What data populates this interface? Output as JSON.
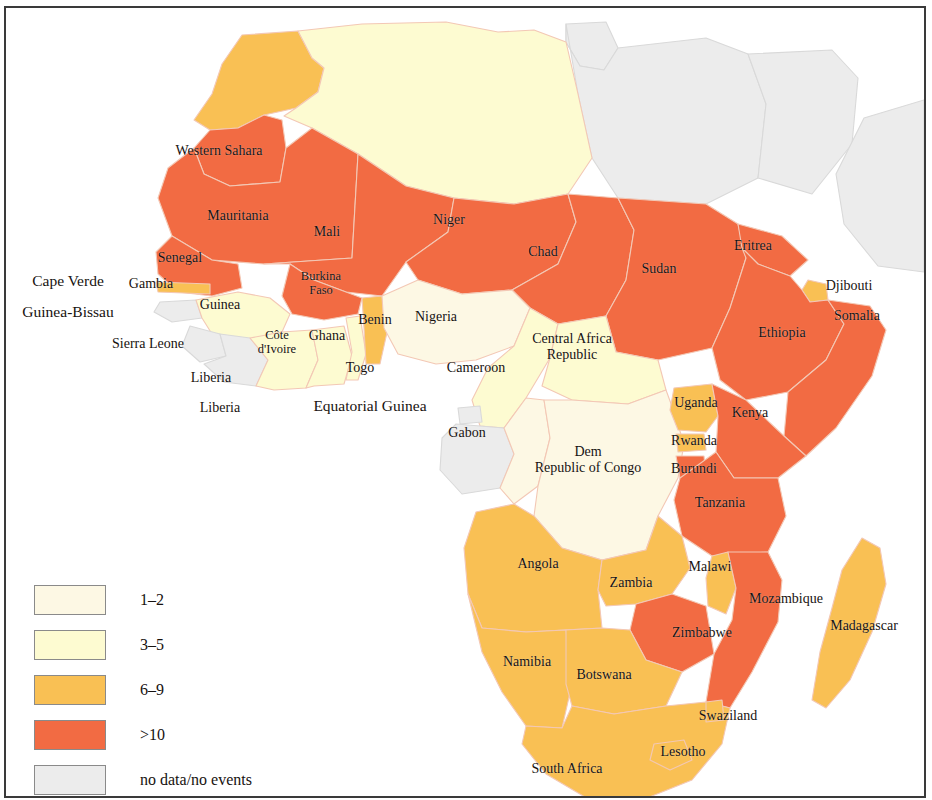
{
  "map": {
    "title": "Africa — reported events by country",
    "region": "Africa",
    "background_color": "#ffffff",
    "border_color": "#3a3a3a",
    "country_border_color": "#f3c8b5",
    "ocean_color": "#ffffff"
  },
  "legend": {
    "title": "",
    "items": [
      {
        "label": "1–2",
        "color": "#fdf8e4",
        "key": "1-2"
      },
      {
        "label": "3–5",
        "color": "#fdfbd1",
        "key": "3-5"
      },
      {
        "label": "6–9",
        "color": "#f9c054",
        "key": "6-9"
      },
      {
        "label": ">10",
        "color": "#f26b43",
        "key": "gt10"
      },
      {
        "label": "no data/no events",
        "color": "#ececec",
        "key": "nodata"
      }
    ]
  },
  "chart_data": {
    "type": "map",
    "classification": "choropleth",
    "bins": [
      "1–2",
      "3–5",
      "6–9",
      ">10",
      "no data/no events"
    ],
    "bin_colors": [
      "#fdf8e4",
      "#fdfbd1",
      "#f9c054",
      "#f26b43",
      "#ececec"
    ],
    "countries": [
      {
        "name": "Morocco",
        "bin": "6–9",
        "labeled": false
      },
      {
        "name": "Algeria",
        "bin": "3–5",
        "labeled": false
      },
      {
        "name": "Tunisia",
        "bin": "no data/no events",
        "labeled": false
      },
      {
        "name": "Libya",
        "bin": "no data/no events",
        "labeled": false
      },
      {
        "name": "Egypt",
        "bin": "no data/no events",
        "labeled": false
      },
      {
        "name": "Western Sahara",
        "bin": ">10",
        "labeled": true
      },
      {
        "name": "Mauritania",
        "bin": ">10",
        "labeled": true
      },
      {
        "name": "Mali",
        "bin": ">10",
        "labeled": true
      },
      {
        "name": "Niger",
        "bin": ">10",
        "labeled": true
      },
      {
        "name": "Chad",
        "bin": ">10",
        "labeled": true
      },
      {
        "name": "Sudan",
        "bin": ">10",
        "labeled": true
      },
      {
        "name": "Eritrea",
        "bin": ">10",
        "labeled": true
      },
      {
        "name": "Djibouti",
        "bin": "6–9",
        "labeled": true
      },
      {
        "name": "Somalia",
        "bin": ">10",
        "labeled": true
      },
      {
        "name": "Ethiopia",
        "bin": ">10",
        "labeled": true
      },
      {
        "name": "Senegal",
        "bin": ">10",
        "labeled": true
      },
      {
        "name": "Cape Verde",
        "bin": "no data/no events",
        "labeled": true
      },
      {
        "name": "Gambia",
        "bin": "6–9",
        "labeled": true
      },
      {
        "name": "Guinea-Bissau",
        "bin": "no data/no events",
        "labeled": true
      },
      {
        "name": "Guinea",
        "bin": "3–5",
        "labeled": true
      },
      {
        "name": "Sierra Leone",
        "bin": "no data/no events",
        "labeled": true
      },
      {
        "name": "Liberia",
        "bin": "no data/no events",
        "labeled": true
      },
      {
        "name": "Burkina Faso",
        "bin": ">10",
        "labeled": true
      },
      {
        "name": "Côte d'Ivoire",
        "bin": "3–5",
        "labeled": true
      },
      {
        "name": "Ghana",
        "bin": "3–5",
        "labeled": true
      },
      {
        "name": "Togo",
        "bin": "3–5",
        "labeled": true
      },
      {
        "name": "Benin",
        "bin": "6–9",
        "labeled": true
      },
      {
        "name": "Nigeria",
        "bin": "1–2",
        "labeled": true
      },
      {
        "name": "Cameroon",
        "bin": "3–5",
        "labeled": true
      },
      {
        "name": "Central Africa Republic",
        "bin": "3–5",
        "labeled": true
      },
      {
        "name": "Equatorial Guinea",
        "bin": "no data/no events",
        "labeled": true
      },
      {
        "name": "Gabon",
        "bin": "no data/no events",
        "labeled": true
      },
      {
        "name": "Dem Republic of Congo",
        "bin": "1–2",
        "labeled": true
      },
      {
        "name": "Uganda",
        "bin": "6–9",
        "labeled": true
      },
      {
        "name": "Rwanda",
        "bin": "6–9",
        "labeled": true
      },
      {
        "name": "Burundi",
        "bin": ">10",
        "labeled": true
      },
      {
        "name": "Kenya",
        "bin": ">10",
        "labeled": true
      },
      {
        "name": "Tanzania",
        "bin": ">10",
        "labeled": true
      },
      {
        "name": "Angola",
        "bin": "6–9",
        "labeled": true
      },
      {
        "name": "Zambia",
        "bin": "6–9",
        "labeled": true
      },
      {
        "name": "Malawi",
        "bin": "6–9",
        "labeled": true
      },
      {
        "name": "Mozambique",
        "bin": ">10",
        "labeled": true
      },
      {
        "name": "Zimbabwe",
        "bin": ">10",
        "labeled": true
      },
      {
        "name": "Namibia",
        "bin": "6–9",
        "labeled": true
      },
      {
        "name": "Botswana",
        "bin": "6–9",
        "labeled": true
      },
      {
        "name": "South Africa",
        "bin": "6–9",
        "labeled": true
      },
      {
        "name": "Lesotho",
        "bin": "6–9",
        "labeled": true
      },
      {
        "name": "Swaziland",
        "bin": "6–9",
        "labeled": true
      },
      {
        "name": "Madagascar",
        "bin": "6–9",
        "labeled": true
      }
    ]
  },
  "labels": [
    {
      "text": "Western Sahara",
      "x": 213,
      "y": 143,
      "size": "sz-m"
    },
    {
      "text": "Mauritania",
      "x": 232,
      "y": 208,
      "size": "sz-m"
    },
    {
      "text": "Mali",
      "x": 321,
      "y": 224,
      "size": "sz-m"
    },
    {
      "text": "Niger",
      "x": 443,
      "y": 212,
      "size": "sz-m"
    },
    {
      "text": "Chad",
      "x": 537,
      "y": 244,
      "size": "sz-m"
    },
    {
      "text": "Sudan",
      "x": 653,
      "y": 261,
      "size": "sz-m"
    },
    {
      "text": "Eritrea",
      "x": 747,
      "y": 238,
      "size": "sz-m"
    },
    {
      "text": "Djibouti",
      "x": 843,
      "y": 278,
      "size": "sz-m"
    },
    {
      "text": "Somalia",
      "x": 851,
      "y": 308,
      "size": "sz-m"
    },
    {
      "text": "Ethiopia",
      "x": 776,
      "y": 325,
      "size": "sz-m"
    },
    {
      "text": "Senegal",
      "x": 174,
      "y": 250,
      "size": "sz-m"
    },
    {
      "text": "Cape Verde",
      "x": 62,
      "y": 273,
      "size": "sz-l"
    },
    {
      "text": "Gambia",
      "x": 145,
      "y": 276,
      "size": "sz-m"
    },
    {
      "text": "Guinea-Bissau",
      "x": 62,
      "y": 304,
      "size": "sz-l"
    },
    {
      "text": "Guinea",
      "x": 214,
      "y": 297,
      "size": "sz-m"
    },
    {
      "text": "Sierra Leone",
      "x": 142,
      "y": 336,
      "size": "sz-m"
    },
    {
      "text": "Liberia",
      "x": 205,
      "y": 370,
      "size": "sz-m"
    },
    {
      "text": "Liberia",
      "x": 214,
      "y": 400,
      "size": "sz-m"
    },
    {
      "text": "Burkina\nFaso",
      "x": 315,
      "y": 275,
      "size": "sz-s"
    },
    {
      "text": "Côte\nd'Ivoire",
      "x": 271,
      "y": 334,
      "size": "sz-s"
    },
    {
      "text": "Ghana",
      "x": 321,
      "y": 328,
      "size": "sz-m"
    },
    {
      "text": "Togo",
      "x": 354,
      "y": 360,
      "size": "sz-m"
    },
    {
      "text": "Benin",
      "x": 369,
      "y": 312,
      "size": "sz-m"
    },
    {
      "text": "Nigeria",
      "x": 430,
      "y": 309,
      "size": "sz-m"
    },
    {
      "text": "Cameroon",
      "x": 470,
      "y": 360,
      "size": "sz-m"
    },
    {
      "text": "Central Africa\nRepublic",
      "x": 566,
      "y": 339,
      "size": "sz-m"
    },
    {
      "text": "Equatorial Guinea",
      "x": 364,
      "y": 398,
      "size": "sz-l"
    },
    {
      "text": "Gabon",
      "x": 461,
      "y": 425,
      "size": "sz-m"
    },
    {
      "text": "Dem\nRepublic of Congo",
      "x": 582,
      "y": 452,
      "size": "sz-m"
    },
    {
      "text": "Uganda",
      "x": 690,
      "y": 395,
      "size": "sz-m"
    },
    {
      "text": "Rwanda",
      "x": 688,
      "y": 433,
      "size": "sz-m"
    },
    {
      "text": "Burundi",
      "x": 688,
      "y": 461,
      "size": "sz-m"
    },
    {
      "text": "Kenya",
      "x": 744,
      "y": 405,
      "size": "sz-m"
    },
    {
      "text": "Tanzania",
      "x": 714,
      "y": 495,
      "size": "sz-m"
    },
    {
      "text": "Angola",
      "x": 532,
      "y": 556,
      "size": "sz-m"
    },
    {
      "text": "Zambia",
      "x": 625,
      "y": 575,
      "size": "sz-m"
    },
    {
      "text": "Malawi",
      "x": 704,
      "y": 559,
      "size": "sz-m"
    },
    {
      "text": "Mozambique",
      "x": 780,
      "y": 591,
      "size": "sz-m"
    },
    {
      "text": "Zimbabwe",
      "x": 696,
      "y": 625,
      "size": "sz-m"
    },
    {
      "text": "Namibia",
      "x": 521,
      "y": 654,
      "size": "sz-m"
    },
    {
      "text": "Botswana",
      "x": 598,
      "y": 667,
      "size": "sz-m"
    },
    {
      "text": "Madagascar",
      "x": 858,
      "y": 618,
      "size": "sz-m"
    },
    {
      "text": "Swaziland",
      "x": 722,
      "y": 708,
      "size": "sz-m"
    },
    {
      "text": "Lesotho",
      "x": 677,
      "y": 744,
      "size": "sz-m"
    },
    {
      "text": "South Africa",
      "x": 561,
      "y": 761,
      "size": "sz-m"
    }
  ]
}
